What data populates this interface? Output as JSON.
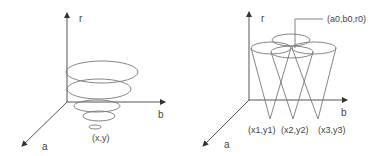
{
  "left_diagram": {
    "axes": {
      "r": "r",
      "b": "b",
      "a": "a"
    },
    "point_label": "(x,y)",
    "description": "Concentric circles of increasing radius stacked along r axis above point (x,y)"
  },
  "right_diagram": {
    "axes": {
      "r": "r",
      "b": "b",
      "a": "a"
    },
    "intersection_label": "(a0,b0,r0)",
    "cone_labels": [
      "(x1,y1)",
      "(x2,y2)",
      "(x3,y3)"
    ],
    "description": "Three cones with apexes at edge points intersecting at (a0,b0,r0)"
  },
  "colors": {
    "line": "#777777",
    "axis": "#555555",
    "text": "#444444",
    "background": "#ffffff"
  }
}
